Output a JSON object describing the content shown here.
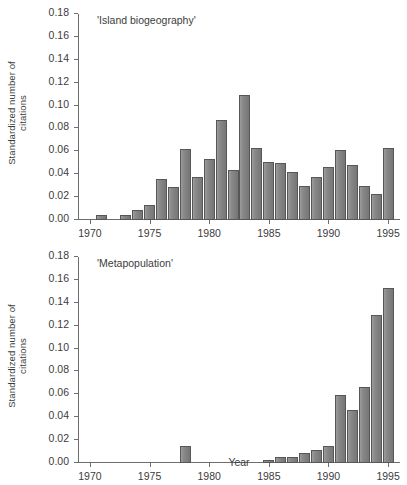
{
  "figure": {
    "ylabel": "Standardized number of\ncitations",
    "xlabel": "Year"
  },
  "chart_data": [
    {
      "type": "bar",
      "title": "'Island biogeography'",
      "xlabel": "",
      "ylabel": "Standardized number of citations",
      "xlim": [
        1969,
        1996
      ],
      "ylim": [
        0.0,
        0.18
      ],
      "ytick_labels": [
        "0.00",
        "0.02",
        "0.04",
        "0.06",
        "0.08",
        "0.10",
        "0.12",
        "0.14",
        "0.16",
        "0.18"
      ],
      "ytick_values": [
        0.0,
        0.02,
        0.04,
        0.06,
        0.08,
        0.1,
        0.12,
        0.14,
        0.16,
        0.18
      ],
      "xtick_labels": [
        "1970",
        "1975",
        "1980",
        "1985",
        "1990",
        "1995"
      ],
      "xtick_values": [
        1970,
        1975,
        1980,
        1985,
        1990,
        1995
      ],
      "grid": false,
      "legend": "none",
      "categories": [
        1970,
        1971,
        1972,
        1973,
        1974,
        1975,
        1976,
        1977,
        1978,
        1979,
        1980,
        1981,
        1982,
        1983,
        1984,
        1985,
        1986,
        1987,
        1988,
        1989,
        1990,
        1991,
        1992,
        1993,
        1994,
        1995
      ],
      "values": [
        0.0,
        0.004,
        0.0,
        0.004,
        0.009,
        0.013,
        0.036,
        0.029,
        0.062,
        0.038,
        0.053,
        0.087,
        0.044,
        0.109,
        0.063,
        0.051,
        0.05,
        0.042,
        0.03,
        0.038,
        0.046,
        0.061,
        0.048,
        0.03,
        0.023,
        0.063
      ]
    },
    {
      "type": "bar",
      "title": "'Metapopulation'",
      "xlabel": "Year",
      "ylabel": "Standardized number of citations",
      "xlim": [
        1969,
        1996
      ],
      "ylim": [
        0.0,
        0.18
      ],
      "ytick_labels": [
        "0.00",
        "0.02",
        "0.04",
        "0.06",
        "0.08",
        "0.10",
        "0.12",
        "0.14",
        "0.16",
        "0.18"
      ],
      "ytick_values": [
        0.0,
        0.02,
        0.04,
        0.06,
        0.08,
        0.1,
        0.12,
        0.14,
        0.16,
        0.18
      ],
      "xtick_labels": [
        "1970",
        "1975",
        "1980",
        "1985",
        "1990",
        "1995"
      ],
      "xtick_values": [
        1970,
        1975,
        1980,
        1985,
        1990,
        1995
      ],
      "grid": false,
      "legend": "none",
      "categories": [
        1970,
        1971,
        1972,
        1973,
        1974,
        1975,
        1976,
        1977,
        1978,
        1979,
        1980,
        1981,
        1982,
        1983,
        1984,
        1985,
        1986,
        1987,
        1988,
        1989,
        1990,
        1991,
        1992,
        1993,
        1994,
        1995
      ],
      "values": [
        0.0,
        0.0,
        0.0,
        0.0,
        0.0,
        0.0,
        0.0,
        0.0,
        0.015,
        0.0,
        0.0,
        0.0,
        0.0,
        0.0,
        0.0,
        0.003,
        0.005,
        0.005,
        0.009,
        0.011,
        0.015,
        0.059,
        0.046,
        0.066,
        0.129,
        0.153
      ]
    }
  ]
}
